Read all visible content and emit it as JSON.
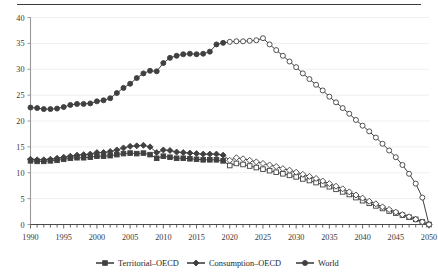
{
  "figure": {
    "top_rule": true,
    "background": "#ffffff",
    "ink_color": "#404040",
    "grid_color": "#ededed",
    "axis_color": "#9a9a9a"
  },
  "legend": {
    "position": "bottom",
    "entries": [
      {
        "label": "Territorial–OECD",
        "marker": "square",
        "marker_name": "legend-marker-square"
      },
      {
        "label": "Consumption–OECD",
        "marker": "diamond",
        "marker_name": "legend-marker-diamond"
      },
      {
        "label": "World",
        "marker": "circle",
        "marker_name": "legend-marker-circle"
      }
    ]
  },
  "chart_data": {
    "type": "line",
    "title": "",
    "subtitle": "",
    "xlabel": "",
    "ylabel": "",
    "xlim": [
      1990,
      2050
    ],
    "ylim": [
      0,
      40
    ],
    "ytick_step": 5,
    "ytick_labels": [
      "0",
      "5",
      "10",
      "15",
      "20",
      "25",
      "30",
      "35",
      "40"
    ],
    "yticks": [
      0,
      5,
      10,
      15,
      20,
      25,
      30,
      35,
      40
    ],
    "xtick_labels": [
      "1990",
      "1995",
      "2000",
      "2005",
      "2010",
      "2015",
      "2020",
      "2025",
      "2030",
      "2035",
      "2040",
      "2045",
      "2050"
    ],
    "xticks": [
      1990,
      1995,
      2000,
      2005,
      2010,
      2015,
      2020,
      2025,
      2030,
      2035,
      2040,
      2045,
      2050
    ],
    "minor_xticks_annual": true,
    "grid": "horizontal",
    "legend_position": "bottom",
    "history_end_year": 2019,
    "x": [
      1990,
      1991,
      1992,
      1993,
      1994,
      1995,
      1996,
      1997,
      1998,
      1999,
      2000,
      2001,
      2002,
      2003,
      2004,
      2005,
      2006,
      2007,
      2008,
      2009,
      2010,
      2011,
      2012,
      2013,
      2014,
      2015,
      2016,
      2017,
      2018,
      2019,
      2020,
      2021,
      2022,
      2023,
      2024,
      2025,
      2026,
      2027,
      2028,
      2029,
      2030,
      2031,
      2032,
      2033,
      2034,
      2035,
      2036,
      2037,
      2038,
      2039,
      2040,
      2041,
      2042,
      2043,
      2044,
      2045,
      2046,
      2047,
      2048,
      2049,
      2050
    ],
    "series": [
      {
        "name": "Territorial–OECD",
        "marker": "square",
        "values": [
          12.3,
          12.2,
          12.2,
          12.3,
          12.4,
          12.6,
          12.8,
          12.9,
          12.9,
          13.0,
          13.2,
          13.2,
          13.3,
          13.5,
          13.7,
          13.8,
          13.7,
          13.8,
          13.5,
          12.8,
          13.2,
          13.0,
          12.8,
          12.8,
          12.7,
          12.6,
          12.5,
          12.5,
          12.5,
          12.3,
          11.4,
          11.8,
          11.6,
          11.3,
          11.0,
          10.7,
          10.4,
          10.1,
          9.8,
          9.5,
          9.2,
          8.8,
          8.5,
          8.1,
          7.7,
          7.3,
          6.8,
          6.3,
          5.8,
          5.2,
          4.6,
          4.1,
          3.6,
          3.1,
          2.6,
          2.2,
          1.8,
          1.4,
          1.0,
          0.5,
          0.0
        ]
      },
      {
        "name": "Consumption–OECD",
        "marker": "diamond",
        "values": [
          12.6,
          12.5,
          12.5,
          12.6,
          12.8,
          13.0,
          13.2,
          13.4,
          13.5,
          13.6,
          13.9,
          13.9,
          14.1,
          14.4,
          14.8,
          15.1,
          15.2,
          15.3,
          15.0,
          13.9,
          14.4,
          14.3,
          14.0,
          13.9,
          13.8,
          13.7,
          13.6,
          13.6,
          13.6,
          13.4,
          12.4,
          12.9,
          12.7,
          12.4,
          12.1,
          11.8,
          11.5,
          11.2,
          10.8,
          10.5,
          10.1,
          9.7,
          9.3,
          8.9,
          8.4,
          7.9,
          7.4,
          6.9,
          6.3,
          5.7,
          5.1,
          4.5,
          4.0,
          3.4,
          2.9,
          2.4,
          1.9,
          1.5,
          1.0,
          0.5,
          0.0
        ]
      },
      {
        "name": "World",
        "marker": "circle",
        "values": [
          22.6,
          22.5,
          22.3,
          22.3,
          22.4,
          22.7,
          23.1,
          23.3,
          23.3,
          23.4,
          23.8,
          24.0,
          24.4,
          25.4,
          26.4,
          27.2,
          28.3,
          29.2,
          29.7,
          29.6,
          31.2,
          32.2,
          32.6,
          32.9,
          33.0,
          32.9,
          33.0,
          33.4,
          34.8,
          35.1,
          35.3,
          35.4,
          35.4,
          35.5,
          35.6,
          36.0,
          34.8,
          33.7,
          32.6,
          31.5,
          30.4,
          29.2,
          28.1,
          27.0,
          25.9,
          24.7,
          23.6,
          22.5,
          21.4,
          20.2,
          19.1,
          18.0,
          16.8,
          15.6,
          14.3,
          13.0,
          11.5,
          9.8,
          7.9,
          5.2,
          0.0
        ]
      }
    ]
  }
}
